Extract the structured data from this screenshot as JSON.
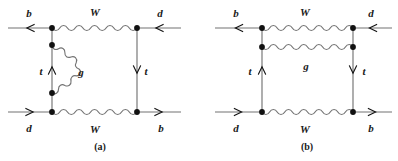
{
  "figure": {
    "type": "feynman-diagram-pair",
    "background_color": "#ffffff",
    "line_color": "#737373",
    "vertex_color": "#111111",
    "label_color": "#1a1a1a",
    "width": 398,
    "height": 161
  },
  "diagrams": [
    {
      "id": "a",
      "caption": "(a)",
      "caption_pos": {
        "x": 100,
        "y": 147
      },
      "labels": [
        {
          "name": "label-b-top-left",
          "text": "b",
          "x": 29,
          "y": 13
        },
        {
          "name": "label-W-top",
          "text": "W",
          "x": 95,
          "y": 12
        },
        {
          "name": "label-d-top-right",
          "text": "d",
          "x": 160,
          "y": 13
        },
        {
          "name": "label-t-left",
          "text": "t",
          "x": 41,
          "y": 71
        },
        {
          "name": "label-g-gluon",
          "text": "g",
          "x": 81,
          "y": 72
        },
        {
          "name": "label-t-right",
          "text": "t",
          "x": 146,
          "y": 71
        },
        {
          "name": "label-d-bottom-left",
          "text": "d",
          "x": 29,
          "y": 128
        },
        {
          "name": "label-W-bottom",
          "text": "W",
          "x": 95,
          "y": 129
        },
        {
          "name": "label-b-bottom-right",
          "text": "b",
          "x": 161,
          "y": 128
        }
      ],
      "vertices": [
        {
          "name": "vertex-top-left",
          "x": 52,
          "y": 28
        },
        {
          "name": "vertex-top-right",
          "x": 137,
          "y": 28
        },
        {
          "name": "vertex-gluon-upper",
          "x": 52,
          "y": 45
        },
        {
          "name": "vertex-gluon-lower",
          "x": 52,
          "y": 93
        },
        {
          "name": "vertex-bottom-left",
          "x": 52,
          "y": 112
        },
        {
          "name": "vertex-bottom-right",
          "x": 137,
          "y": 112
        }
      ],
      "propagators": {
        "w_top": {
          "name": "w-boson-top",
          "x1": 52,
          "y1": 28,
          "x2": 137,
          "y2": 28
        },
        "w_bottom": {
          "name": "w-boson-bottom",
          "x1": 52,
          "y1": 112,
          "x2": 137,
          "y2": 112
        },
        "gluon": {
          "name": "gluon-loop",
          "type": "arc",
          "x": 52,
          "y1": 45,
          "y2": 93,
          "bulge": 27
        }
      },
      "fermions": [
        {
          "name": "fermion-b-incoming-top",
          "x1": 8,
          "y1": 28,
          "x2": 52,
          "y2": 28,
          "arrow": "left"
        },
        {
          "name": "fermion-d-incoming-top",
          "x1": 181,
          "y1": 28,
          "x2": 137,
          "y2": 28,
          "arrow": "left"
        },
        {
          "name": "fermion-d-outgoing-bot",
          "x1": 8,
          "y1": 112,
          "x2": 52,
          "y2": 112,
          "arrow": "right"
        },
        {
          "name": "fermion-b-outgoing-bot",
          "x1": 137,
          "y1": 112,
          "x2": 181,
          "y2": 112,
          "arrow": "right"
        },
        {
          "name": "fermion-top-quark-left",
          "x1": 52,
          "y1": 112,
          "x2": 52,
          "y2": 28,
          "arrow": "up"
        },
        {
          "name": "fermion-top-quark-right",
          "x1": 137,
          "y1": 28,
          "x2": 137,
          "y2": 112,
          "arrow": "down"
        }
      ]
    },
    {
      "id": "b",
      "caption": "(b)",
      "caption_pos": {
        "x": 307,
        "y": 147
      },
      "labels": [
        {
          "name": "label-b-top-left",
          "text": "b",
          "x": 236,
          "y": 13
        },
        {
          "name": "label-W-top",
          "text": "W",
          "x": 305,
          "y": 12
        },
        {
          "name": "label-d-top-right",
          "text": "d",
          "x": 371,
          "y": 13
        },
        {
          "name": "label-t-left",
          "text": "t",
          "x": 250,
          "y": 71
        },
        {
          "name": "label-g-gluon",
          "text": "g",
          "x": 306,
          "y": 66
        },
        {
          "name": "label-t-right",
          "text": "t",
          "x": 364,
          "y": 71
        },
        {
          "name": "label-d-bottom-left",
          "text": "d",
          "x": 236,
          "y": 128
        },
        {
          "name": "label-W-bottom",
          "text": "W",
          "x": 305,
          "y": 129
        },
        {
          "name": "label-b-bottom-right",
          "text": "b",
          "x": 371,
          "y": 128
        }
      ],
      "vertices": [
        {
          "name": "vertex-top-left",
          "x": 262,
          "y": 28
        },
        {
          "name": "vertex-top-right",
          "x": 353,
          "y": 28
        },
        {
          "name": "vertex-gluon-left",
          "x": 262,
          "y": 47
        },
        {
          "name": "vertex-gluon-right",
          "x": 353,
          "y": 47
        },
        {
          "name": "vertex-bottom-left",
          "x": 262,
          "y": 112
        },
        {
          "name": "vertex-bottom-right",
          "x": 353,
          "y": 112
        }
      ],
      "propagators": {
        "w_top": {
          "name": "w-boson-top",
          "x1": 262,
          "y1": 28,
          "x2": 353,
          "y2": 28
        },
        "w_bottom": {
          "name": "w-boson-bottom",
          "x1": 262,
          "y1": 112,
          "x2": 353,
          "y2": 112
        },
        "gluon": {
          "name": "gluon-exchange",
          "type": "straight",
          "x1": 262,
          "y1": 47,
          "x2": 353,
          "y2": 47
        }
      },
      "fermions": [
        {
          "name": "fermion-b-incoming-top",
          "x1": 215,
          "y1": 28,
          "x2": 262,
          "y2": 28,
          "arrow": "left"
        },
        {
          "name": "fermion-d-incoming-top",
          "x1": 392,
          "y1": 28,
          "x2": 353,
          "y2": 28,
          "arrow": "left"
        },
        {
          "name": "fermion-d-outgoing-bot",
          "x1": 215,
          "y1": 112,
          "x2": 262,
          "y2": 112,
          "arrow": "right"
        },
        {
          "name": "fermion-b-outgoing-bot",
          "x1": 353,
          "y1": 112,
          "x2": 392,
          "y2": 112,
          "arrow": "right"
        },
        {
          "name": "fermion-top-quark-left",
          "x1": 262,
          "y1": 112,
          "x2": 262,
          "y2": 28,
          "arrow": "up"
        },
        {
          "name": "fermion-top-quark-right",
          "x1": 353,
          "y1": 28,
          "x2": 353,
          "y2": 112,
          "arrow": "down"
        }
      ]
    }
  ]
}
